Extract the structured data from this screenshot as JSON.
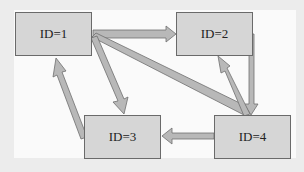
{
  "diagram": {
    "type": "directed-graph",
    "nodes": [
      {
        "id": "1",
        "label": "ID=1"
      },
      {
        "id": "2",
        "label": "ID=2"
      },
      {
        "id": "3",
        "label": "ID=3"
      },
      {
        "id": "4",
        "label": "ID=4"
      }
    ],
    "edges": [
      {
        "from": "1",
        "to": "2"
      },
      {
        "from": "1",
        "to": "3"
      },
      {
        "from": "1",
        "to": "4"
      },
      {
        "from": "2",
        "to": "4"
      },
      {
        "from": "4",
        "to": "2"
      },
      {
        "from": "4",
        "to": "3"
      },
      {
        "from": "3",
        "to": "1"
      }
    ],
    "colors": {
      "node_fill": "#d6d6d6",
      "node_border": "#6a6a6a",
      "arrow_fill": "#b8b8b8",
      "arrow_border": "#6f6f6f",
      "background": "#fafafa"
    }
  }
}
